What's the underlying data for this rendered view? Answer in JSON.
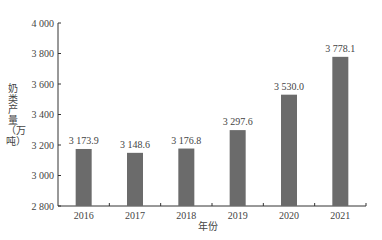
{
  "chart_data": {
    "type": "bar",
    "title": "",
    "xlabel": "年份",
    "ylabel": "奶类产量（万吨）",
    "categories": [
      "2016",
      "2017",
      "2018",
      "2019",
      "2020",
      "2021"
    ],
    "values": [
      3173.9,
      3148.6,
      3176.8,
      3297.6,
      3530.0,
      3778.1
    ],
    "data_labels": [
      "3 173.9",
      "3 148.6",
      "3 176.8",
      "3 297.6",
      "3 530.0",
      "3 778.1"
    ],
    "ylim": [
      2800,
      4000
    ],
    "yticks": [
      2800,
      3000,
      3200,
      3400,
      3600,
      3800,
      4000
    ],
    "ytick_labels": [
      "2 800",
      "3 000",
      "3 200",
      "3 400",
      "3 600",
      "3 800",
      "4 000"
    ],
    "grid": false,
    "legend": null,
    "bar_color": "#6b6b6b"
  }
}
